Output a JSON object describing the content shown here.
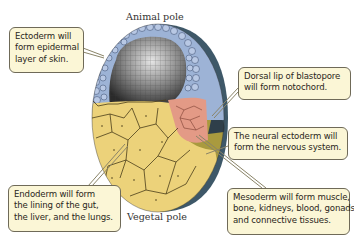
{
  "labels": {
    "animal_pole": "Animal pole",
    "vegetal_pole": "Vegetal pole"
  },
  "callouts": {
    "ectoderm": [
      "Ectoderm will",
      "form epidermal",
      "layer of skin."
    ],
    "dorsal_lip": [
      "Dorsal lip of blastopore",
      "will form notochord."
    ],
    "neural_ectoderm": [
      "The neural ectoderm will",
      "form the nervous system."
    ],
    "endoderm": [
      "Endoderm will form",
      "the lining of the gut,",
      "the liver, and the lungs."
    ],
    "mesoderm": [
      "Mesoderm will form muscle,",
      "bone, kidneys, blood, gonads,",
      "and connective tissues."
    ]
  },
  "colors": {
    "ectoderm": "#9db3d6",
    "endoderm": "#ecd27a",
    "mesoderm": "#e39a86",
    "outer_dark": "#3e5868",
    "neural_yellow": "#a99a3e",
    "callout_fill": "#fbf6d6",
    "callout_border": "#6f6a58"
  }
}
